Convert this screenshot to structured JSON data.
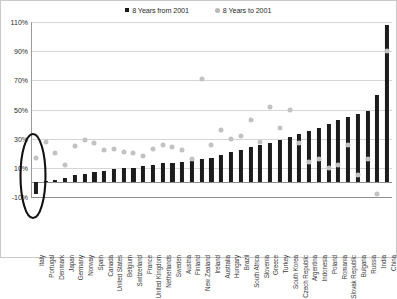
{
  "legend": {
    "items": [
      {
        "label": "8 Years from 2001",
        "marker": "black-square-marker",
        "color": "#1a1a1a"
      },
      {
        "label": "8 Years to 2001",
        "marker": "gray-circle-marker",
        "color": "#b8b8b8"
      }
    ]
  },
  "axis": {
    "y_ticks": [
      "110%",
      "90%",
      "70%",
      "50%",
      "30%",
      "10%",
      "-10%"
    ]
  },
  "annotation": {
    "name": "highlight-ellipse-italy",
    "target": "Italy"
  },
  "chart_data": {
    "type": "bar",
    "title": "",
    "subtitle": "",
    "xlabel": "",
    "ylabel": "",
    "ylim": [
      -10,
      110
    ],
    "ytick_values": [
      110,
      90,
      70,
      50,
      30,
      10,
      -10
    ],
    "ytick_labels": [
      "110%",
      "90%",
      "70%",
      "50%",
      "30%",
      "10%",
      "-10%"
    ],
    "grid": true,
    "legend_position": "top-center",
    "categories": [
      "Italy",
      "Portugal",
      "Denmark",
      "Japan",
      "Germany",
      "Norway",
      "Spain",
      "Canada",
      "United States",
      "Belgium",
      "Switzerland",
      "France",
      "United Kingdom",
      "Netherlands",
      "Sweden",
      "Austria",
      "Finland",
      "New Zealand",
      "Ireland",
      "Australia",
      "Hungary",
      "Brazil",
      "South Africa",
      "Slovenia",
      "Greece",
      "Turkey",
      "South Korea",
      "Czech Republic",
      "Argentina",
      "Indonesia",
      "Poland",
      "Romania",
      "Slovak Republic",
      "Bulgaria",
      "Russia",
      "India",
      "China"
    ],
    "series": [
      {
        "name": "8 Years from 2001",
        "type": "bar",
        "color": "#1c1c1c",
        "values": [
          -8,
          1,
          2,
          3,
          5,
          6,
          7,
          8,
          9,
          10,
          10,
          11,
          12,
          13,
          13,
          14,
          15,
          16,
          17,
          19,
          21,
          22,
          24,
          26,
          27,
          29,
          31,
          33,
          35,
          37,
          40,
          43,
          45,
          47,
          49,
          60,
          108
        ]
      },
      {
        "name": "8 Years to 2001",
        "type": "scatter",
        "color": "#c2c2c2",
        "values": [
          17,
          28,
          20,
          12,
          25,
          29,
          27,
          22,
          23,
          21,
          20,
          18,
          23,
          26,
          24,
          22,
          16,
          71,
          26,
          36,
          30,
          32,
          43,
          28,
          52,
          37,
          50,
          27,
          14,
          16,
          10,
          12,
          26,
          5,
          16,
          -8,
          90
        ]
      }
    ]
  }
}
